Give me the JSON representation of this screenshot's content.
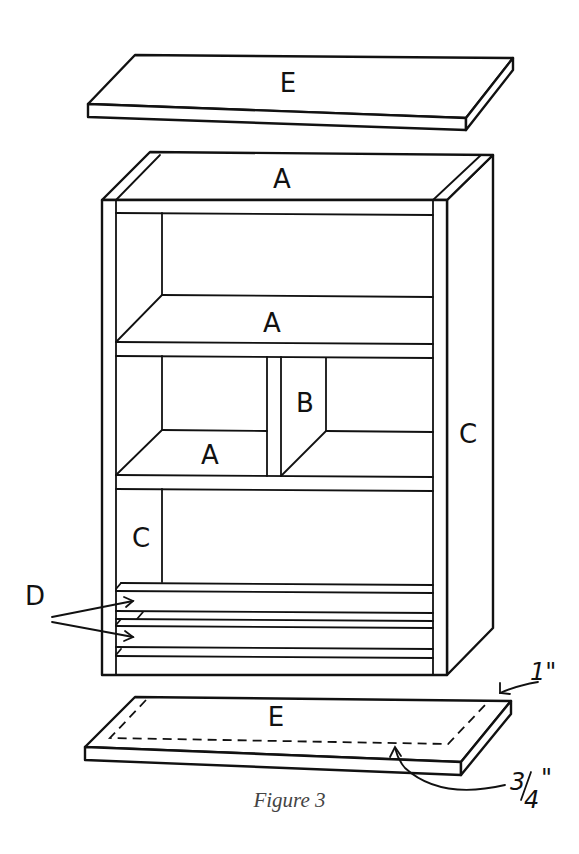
{
  "figure": {
    "caption": "Figure 3",
    "type": "exploded isometric assembly diagram of a bookcase cabinet"
  },
  "labels": {
    "top_board": "E",
    "top_panel": "A",
    "middle_shelf": "A",
    "lower_left_shelf": "A",
    "divider": "B",
    "right_side": "C",
    "inner_left_side": "C",
    "rails": "D",
    "bottom_board": "E"
  },
  "dimensions": {
    "overhang": "1\"",
    "inset": "3/4\"",
    "inset_numerator": "3",
    "inset_denominator": "4"
  },
  "colors": {
    "line": "#111111",
    "background": "#ffffff",
    "caption": "#444444"
  }
}
